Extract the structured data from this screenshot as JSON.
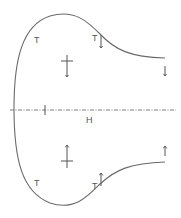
{
  "diagram": {
    "colors": {
      "line": "#6a6a6a",
      "text": "#555555",
      "background": "#ffffff"
    },
    "centerline": {
      "label": "H",
      "style": "dash-dot"
    },
    "upper": {
      "labels": [
        {
          "id": "t-left-upper",
          "text": "T"
        },
        {
          "id": "t-mid-upper",
          "text": "T"
        }
      ],
      "arrows": [
        {
          "id": "arrow-mid-upper",
          "direction": "down"
        },
        {
          "id": "arrow-right-upper",
          "direction": "down"
        },
        {
          "id": "arrow-center-upper",
          "direction": "down",
          "with_crossbar": true
        }
      ]
    },
    "lower": {
      "labels": [
        {
          "id": "t-left-lower",
          "text": "T"
        },
        {
          "id": "t-mid-lower",
          "text": "T"
        }
      ],
      "arrows": [
        {
          "id": "arrow-mid-lower",
          "direction": "up"
        },
        {
          "id": "arrow-right-lower",
          "direction": "up"
        },
        {
          "id": "arrow-center-lower",
          "direction": "up",
          "with_crossbar": true
        }
      ]
    }
  }
}
